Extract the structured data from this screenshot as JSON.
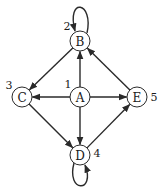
{
  "diagram": {
    "type": "directed-graph",
    "colors": {
      "stroke": "#2a2a2a",
      "text": "#1a1a1a",
      "background": "#ffffff"
    },
    "nodes": [
      {
        "id": "A",
        "label": "A",
        "number": "1",
        "x": 80,
        "y": 97,
        "num_x": 68,
        "num_y": 84
      },
      {
        "id": "B",
        "label": "B",
        "number": "2",
        "x": 80,
        "y": 41,
        "num_x": 67,
        "num_y": 26
      },
      {
        "id": "C",
        "label": "C",
        "number": "3",
        "x": 22,
        "y": 97,
        "num_x": 9,
        "num_y": 85
      },
      {
        "id": "D",
        "label": "D",
        "number": "4",
        "x": 80,
        "y": 155,
        "num_x": 97,
        "num_y": 153
      },
      {
        "id": "E",
        "label": "E",
        "number": "5",
        "x": 137,
        "y": 97,
        "num_x": 154,
        "num_y": 97
      }
    ],
    "edges": [
      {
        "from": "A",
        "to": "B"
      },
      {
        "from": "A",
        "to": "C"
      },
      {
        "from": "A",
        "to": "E"
      },
      {
        "from": "A",
        "to": "D"
      },
      {
        "from": "B",
        "to": "C"
      },
      {
        "from": "E",
        "to": "B"
      },
      {
        "from": "C",
        "to": "D"
      },
      {
        "from": "D",
        "to": "E"
      },
      {
        "from": "B",
        "to": "B",
        "self_loop": true
      },
      {
        "from": "D",
        "to": "D",
        "self_loop": true
      }
    ]
  }
}
